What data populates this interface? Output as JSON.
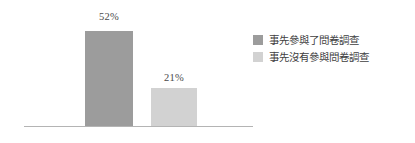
{
  "chart_data": {
    "type": "bar",
    "title": "",
    "subtitle": "",
    "xlabel": "",
    "ylabel": "",
    "grid": false,
    "legend_position": "right",
    "axis_baseline_visible": true,
    "ylim": [
      0,
      60
    ],
    "categories": [
      "事先參與了問卷調查",
      "事先沒有參與問卷調查"
    ],
    "values": [
      52,
      21
    ],
    "value_labels": [
      "52%",
      "21%"
    ],
    "colors": [
      "#9c9c9c",
      "#d2d2d2"
    ],
    "series": [
      {
        "name": "比例",
        "values": [
          52,
          21
        ]
      }
    ]
  },
  "bars": [
    {
      "label": "52%",
      "value": 52,
      "color": "#9c9c9c",
      "category": "事先參與了問卷調查"
    },
    {
      "label": "21%",
      "value": 21,
      "color": "#d2d2d2",
      "category": "事先沒有參與問卷調查"
    }
  ],
  "legend": {
    "items": [
      {
        "label": "事先參與了問卷調查",
        "color": "#9c9c9c"
      },
      {
        "label": "事先沒有參與問卷調查",
        "color": "#d2d2d2"
      }
    ]
  },
  "axis": {
    "line_color": "#b4b4b4"
  }
}
